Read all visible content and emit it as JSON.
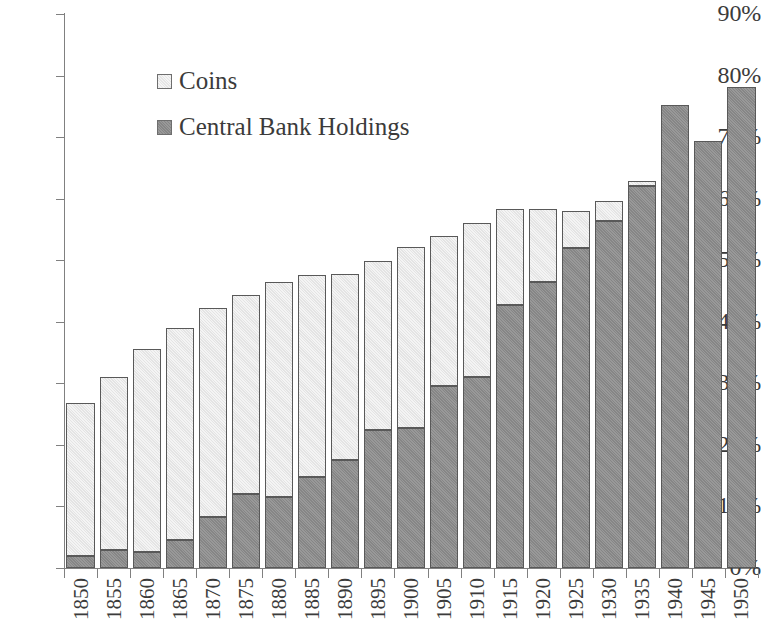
{
  "chart_data": {
    "type": "bar",
    "subtype": "stacked-bar",
    "title": "",
    "xlabel": "",
    "ylabel": "",
    "ylim": [
      0,
      90
    ],
    "y_unit": "%",
    "grid": false,
    "legend_position": "upper-left-inside",
    "y_ticks": [
      "0%",
      "10%",
      "20%",
      "30%",
      "40%",
      "50%",
      "60%",
      "70%",
      "80%",
      "90%"
    ],
    "y_tick_values": [
      0,
      10,
      20,
      30,
      40,
      50,
      60,
      70,
      80,
      90
    ],
    "categories": [
      "1850",
      "1855",
      "1860",
      "1865",
      "1870",
      "1875",
      "1880",
      "1885",
      "1890",
      "1895",
      "1900",
      "1905",
      "1910",
      "1915",
      "1920",
      "1925",
      "1930",
      "1935",
      "1940",
      "1945",
      "1950"
    ],
    "series": [
      {
        "name": "Central Bank Holdings",
        "color": "#8d8d8d",
        "values": [
          1.9,
          3.0,
          2.6,
          4.5,
          8.3,
          12.0,
          11.6,
          14.8,
          17.5,
          22.4,
          22.8,
          29.5,
          31.0,
          42.8,
          46.5,
          52.0,
          56.4,
          62.1,
          75.2,
          69.4,
          78.2
        ]
      },
      {
        "name": "Coins",
        "color": "#e9e9e9",
        "values": [
          24.9,
          28.0,
          33.0,
          34.5,
          34.0,
          32.4,
          34.8,
          32.8,
          30.2,
          27.5,
          29.4,
          24.5,
          25.1,
          15.5,
          11.8,
          6.0,
          3.3,
          0.7,
          0.0,
          0.0,
          0.0
        ]
      }
    ],
    "totals": [
      26.8,
      31.0,
      35.6,
      39.0,
      42.3,
      44.4,
      46.4,
      47.6,
      47.7,
      49.9,
      52.2,
      54.0,
      56.1,
      58.3,
      58.3,
      58.0,
      59.7,
      62.8,
      75.2,
      69.4,
      78.2
    ]
  },
  "legend": {
    "items": [
      {
        "label": "Coins",
        "swatch": "light-square-swatch"
      },
      {
        "label": "Central Bank Holdings",
        "swatch": "dark-square-swatch"
      }
    ]
  }
}
